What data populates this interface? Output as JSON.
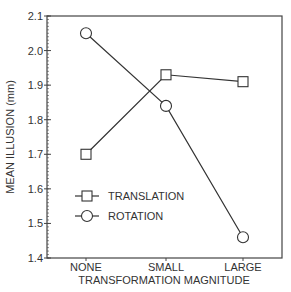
{
  "chart_data": {
    "type": "line",
    "title": "",
    "xlabel": "TRANSFORMATION MAGNITUDE",
    "ylabel": "MEAN ILLUSION (mm)",
    "categories": [
      "NONE",
      "SMALL",
      "LARGE"
    ],
    "ylim": [
      1.4,
      2.1
    ],
    "yticks": [
      "1.4",
      "1.5",
      "1.6",
      "1.7",
      "1.8",
      "1.9",
      "2.0",
      "2.1"
    ],
    "grid": false,
    "legend_position": "bottom-left",
    "series": [
      {
        "name": "TRANSLATION",
        "marker": "square",
        "values": [
          1.7,
          1.93,
          1.91
        ]
      },
      {
        "name": "ROTATION",
        "marker": "circle",
        "values": [
          2.05,
          1.84,
          1.46
        ]
      }
    ]
  },
  "colors": {
    "line": "#333333",
    "frame": "#444444",
    "background": "#ffffff"
  }
}
